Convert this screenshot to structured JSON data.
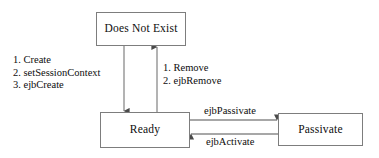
{
  "diagram": {
    "background_color": "#ffffff",
    "line_color": "#808080",
    "border_color": "#7d7d7d",
    "text_color": "#0d0d0d",
    "states": {
      "does_not_exist": "Does Not Exist",
      "ready": "Ready",
      "passivate": "Passivate"
    },
    "transitions": {
      "create_sequence": {
        "step_1": "1. Create",
        "step_2": "2. setSessionContext",
        "step_3": "3. ejbCreate"
      },
      "remove_sequence": {
        "step_1": "1. Remove",
        "step_2": "2. ejbRemove"
      },
      "ejb_passivate": "ejbPassivate",
      "ejb_activate": "ejbActivate"
    }
  }
}
